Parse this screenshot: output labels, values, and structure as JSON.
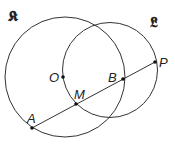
{
  "diagram": {
    "title": "",
    "colors": {
      "stroke": "#333333",
      "point": "#111111",
      "background": "#ffffff"
    },
    "circles": [
      {
        "id": "K",
        "label": "𝕶",
        "cx": 65,
        "cy": 77,
        "r": 60,
        "label_x": 8,
        "label_y": 21
      },
      {
        "id": "L",
        "label": "𝕷",
        "cx": 110,
        "cy": 70,
        "r": 47.5,
        "label_x": 150,
        "label_y": 27
      }
    ],
    "segment": {
      "from": "A",
      "to": "P"
    },
    "points": [
      {
        "id": "O",
        "label": "O",
        "x": 63,
        "y": 77,
        "label_x": 49,
        "label_y": 82
      },
      {
        "id": "M",
        "label": "M",
        "x": 76,
        "y": 104,
        "label_x": 74,
        "label_y": 99
      },
      {
        "id": "B",
        "label": "B",
        "x": 123,
        "y": 79,
        "label_x": 108,
        "label_y": 82
      },
      {
        "id": "P",
        "label": "P",
        "x": 155,
        "y": 62,
        "label_x": 159,
        "label_y": 67
      },
      {
        "id": "A",
        "label": "A",
        "x": 32,
        "y": 128,
        "label_x": 27,
        "label_y": 123
      }
    ]
  }
}
